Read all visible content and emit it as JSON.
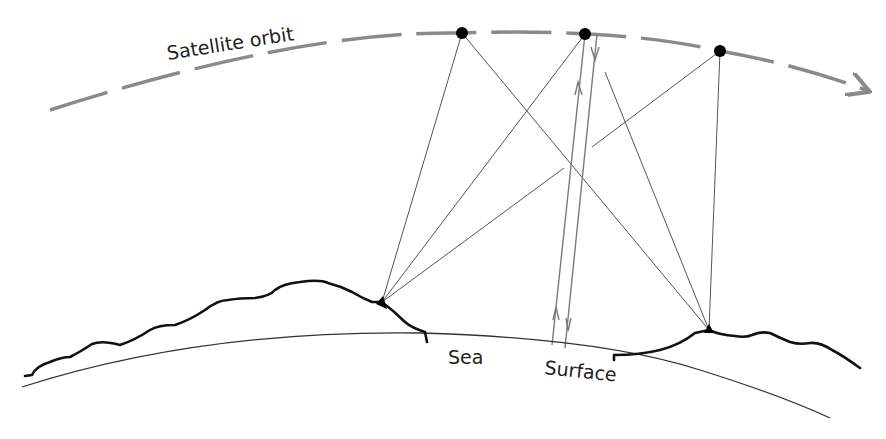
{
  "labels": {
    "orbit": "Satellite orbit",
    "sea": "Sea",
    "surface": "Surface"
  },
  "colors": {
    "orbit": "#8a8a8a",
    "ray": "#555555",
    "signal": "#7a7a7a",
    "terrain": "#111111",
    "earth": "#333333",
    "satellite": "#000000"
  },
  "satellites": [
    {
      "id": "sat-1",
      "x": 462,
      "y": 33
    },
    {
      "id": "sat-2",
      "x": 585,
      "y": 34
    },
    {
      "id": "sat-3",
      "x": 720,
      "y": 51
    }
  ],
  "ground_stations": [
    {
      "id": "station-left",
      "x": 382,
      "y": 302
    },
    {
      "id": "station-right",
      "x": 709,
      "y": 330
    }
  ]
}
